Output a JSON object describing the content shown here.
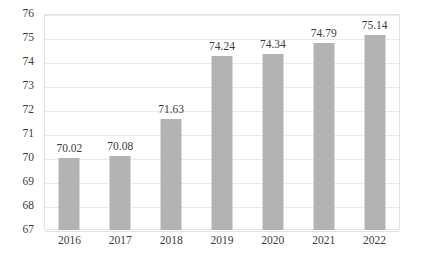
{
  "chart_data": {
    "type": "bar",
    "title": "",
    "subtitle": "",
    "xlabel": "",
    "ylabel": "",
    "categories": [
      "2016",
      "2017",
      "2018",
      "2019",
      "2020",
      "2021",
      "2022"
    ],
    "values": [
      70.02,
      70.08,
      71.63,
      74.24,
      74.34,
      74.79,
      75.14
    ],
    "data_labels": [
      "70.02",
      "70.08",
      "71.63",
      "74.24",
      "74.34",
      "74.79",
      "75.14"
    ],
    "ylim": [
      67,
      76
    ],
    "y_ticks": [
      67,
      68,
      69,
      70,
      71,
      72,
      73,
      74,
      75,
      76
    ],
    "y_tick_labels": [
      "67",
      "68",
      "69",
      "70",
      "71",
      "72",
      "73",
      "74",
      "75",
      "76"
    ],
    "grid": true,
    "grid_axis": "y",
    "legend": false,
    "legend_position": "none",
    "series": [
      {
        "name": "",
        "values": [
          70.02,
          70.08,
          71.63,
          74.24,
          74.34,
          74.79,
          75.14
        ]
      }
    ],
    "colors": {
      "bar": "#B3B3B3",
      "gridline": "#EAEAEA",
      "plot_border": "#E4E4E4",
      "text": "#3C3C3C",
      "background": "#FFFFFF"
    }
  }
}
